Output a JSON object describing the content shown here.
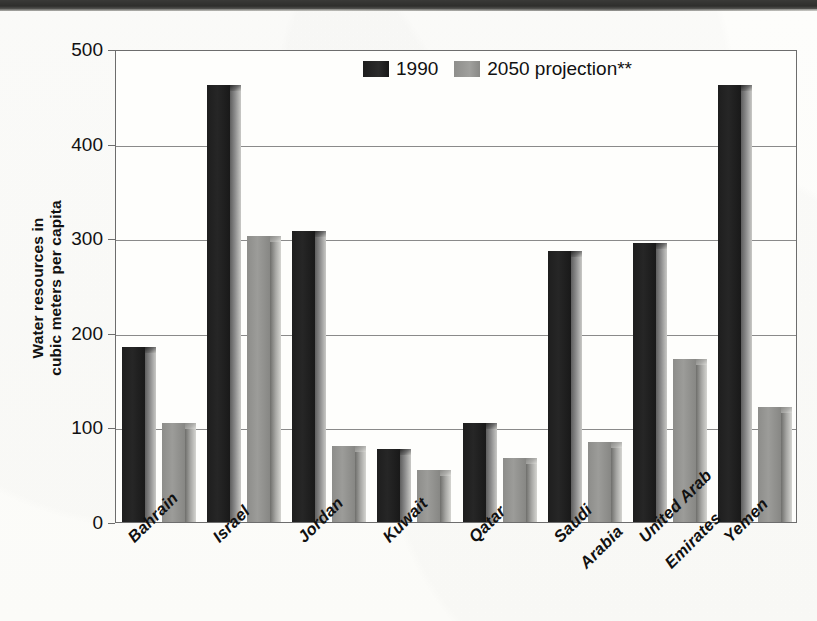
{
  "chart_data": {
    "type": "bar",
    "title": "",
    "xlabel": "",
    "ylabel": "Water resources in cubic meters per capita",
    "ylabel_line1": "Water resources in",
    "ylabel_line2": "cubic meters per capita",
    "ylim": [
      0,
      500
    ],
    "yticks": [
      0,
      100,
      200,
      300,
      400,
      500
    ],
    "ytick_labels": [
      "0",
      "100",
      "200",
      "300",
      "400",
      "500"
    ],
    "grid": true,
    "legend_position": "top-center",
    "categories": [
      "Bahrain",
      "Israel",
      "Jordan",
      "Kuwait",
      "Qatar",
      "Saudi Arabia",
      "United Arab Emirates",
      "Yemen"
    ],
    "category_lines": [
      [
        "Bahrain"
      ],
      [
        "Israel"
      ],
      [
        "Jordan"
      ],
      [
        "Kuwait"
      ],
      [
        "Qatar"
      ],
      [
        "Saudi",
        "Arabia"
      ],
      [
        "United Arab",
        "Emirates"
      ],
      [
        "Yemen"
      ]
    ],
    "series": [
      {
        "name": "1990",
        "color": "#1f1f1f",
        "values": [
          185,
          462,
          308,
          77,
          105,
          286,
          295,
          462
        ]
      },
      {
        "name": "2050 projection**",
        "color": "#979794",
        "values": [
          105,
          302,
          80,
          55,
          68,
          85,
          172,
          122
        ]
      }
    ]
  },
  "legend": {
    "items": [
      {
        "label": "1990",
        "swatch": "s1990"
      },
      {
        "label": "2050 projection**",
        "swatch": "s2050"
      }
    ]
  },
  "colors": {
    "series_1990": "#1f1f1f",
    "series_2050": "#979794",
    "axis": "#6d6d6d",
    "grid": "#8a8a8a",
    "text": "#111111",
    "background": "#fdfdfb"
  }
}
